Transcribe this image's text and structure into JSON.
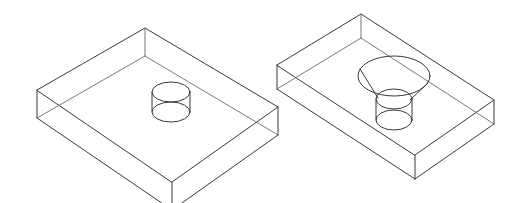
{
  "document": {
    "title": "Isometric Wireframe Blocks",
    "background_color": "#ffffff",
    "line_color": "#3a3a3a",
    "hidden_line_color": "#6a6a6a",
    "canvas_width": 515,
    "canvas_height": 203,
    "projection": "isometric",
    "render_style": "wireframe-transparent",
    "caption": ""
  },
  "figures": [
    {
      "id": "figure-left",
      "name": "rectangular-plate-with-through-hole",
      "label": "",
      "block": {
        "name": "rectangular-plate",
        "top_face_vertices": "37,90 145,28 278,107 172,182",
        "bottom_offset_y": 28,
        "visible_bottom_vertices": "37,118 172,210 278,135",
        "description": "Thin rectangular plate drawn in isometric projection, transparent wireframe showing hidden rear edges."
      },
      "feature": {
        "name": "straight-through-hole",
        "type": "cylinder",
        "center_x": 171,
        "top_ellipse_cy": 92,
        "bottom_ellipse_cy": 112,
        "rx": 19,
        "ry": 10,
        "description": "Plain cylindrical through hole, two stacked ellipses joined by vertical silhouette lines."
      }
    },
    {
      "id": "figure-right",
      "name": "rectangular-plate-with-countersunk-hole",
      "label": "",
      "block": {
        "name": "rectangular-plate",
        "top_face_vertices": "277,65 361,14 494,100 415,155",
        "bottom_offset_y": 24,
        "visible_bottom_vertices": "277,89 415,179 494,124",
        "description": "Thicker rectangular plate drawn in isometric projection, transparent wireframe showing hidden rear edges."
      },
      "feature": {
        "name": "countersunk-through-hole",
        "type": "cone-plus-cylinder",
        "countersink": {
          "center_x": 394,
          "cy": 76,
          "rx": 36,
          "ry": 20,
          "description": "Large countersink mouth ellipse on the top face."
        },
        "cone_slant_lines": [
          "360,70 378,98",
          "428,82 410,100"
        ],
        "bore": {
          "center_x": 394,
          "top_ellipse_cy": 99,
          "bottom_ellipse_cy": 120,
          "rx": 18,
          "ry": 10,
          "description": "Cylindrical bore below the countersink, two stacked ellipses joined by vertical silhouette lines."
        }
      }
    }
  ],
  "legend": {
    "visible": false,
    "items": []
  }
}
